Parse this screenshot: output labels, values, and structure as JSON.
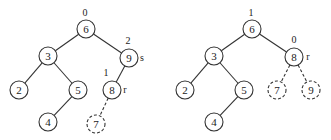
{
  "trees": [
    {
      "nodes": [
        {
          "id": "6",
          "label": "6",
          "x": 86,
          "y": 29,
          "dashed": false,
          "annot": "0",
          "ax": 85,
          "ay": 16
        },
        {
          "id": "3",
          "label": "3",
          "x": 48,
          "y": 56,
          "dashed": false
        },
        {
          "id": "9",
          "label": "9",
          "x": 129,
          "y": 58,
          "dashed": false,
          "annot": "2",
          "ax": 128,
          "ay": 44,
          "side": "s",
          "sx": 142,
          "sy": 61
        },
        {
          "id": "2",
          "label": "2",
          "x": 19,
          "y": 90,
          "dashed": false
        },
        {
          "id": "5",
          "label": "5",
          "x": 78,
          "y": 90,
          "dashed": false
        },
        {
          "id": "8",
          "label": "8",
          "x": 112,
          "y": 90,
          "dashed": false,
          "annot": "1",
          "ax": 106,
          "ay": 76,
          "side": "r",
          "sx": 125,
          "sy": 93
        },
        {
          "id": "4",
          "label": "4",
          "x": 48,
          "y": 122,
          "dashed": false
        },
        {
          "id": "7",
          "label": "7",
          "x": 96,
          "y": 124,
          "dashed": true
        }
      ],
      "edges": [
        {
          "from": "6",
          "to": "3",
          "dashed": false
        },
        {
          "from": "6",
          "to": "9",
          "dashed": false
        },
        {
          "from": "3",
          "to": "2",
          "dashed": false
        },
        {
          "from": "3",
          "to": "5",
          "dashed": false
        },
        {
          "from": "9",
          "to": "8",
          "dashed": false
        },
        {
          "from": "5",
          "to": "4",
          "dashed": false
        },
        {
          "from": "8",
          "to": "7",
          "dashed": true
        }
      ]
    },
    {
      "nodes": [
        {
          "id": "6",
          "label": "6",
          "x": 252,
          "y": 29,
          "dashed": false,
          "annot": "1",
          "ax": 251,
          "ay": 16
        },
        {
          "id": "3",
          "label": "3",
          "x": 214,
          "y": 56,
          "dashed": false
        },
        {
          "id": "8",
          "label": "8",
          "x": 294,
          "y": 57,
          "dashed": false,
          "annot": "0",
          "ax": 294,
          "ay": 43,
          "side": "r",
          "sx": 308,
          "sy": 60
        },
        {
          "id": "2",
          "label": "2",
          "x": 185,
          "y": 90,
          "dashed": false
        },
        {
          "id": "5",
          "label": "5",
          "x": 244,
          "y": 90,
          "dashed": false
        },
        {
          "id": "7",
          "label": "7",
          "x": 277,
          "y": 90,
          "dashed": true
        },
        {
          "id": "9",
          "label": "9",
          "x": 311,
          "y": 90,
          "dashed": true
        },
        {
          "id": "4",
          "label": "4",
          "x": 214,
          "y": 122,
          "dashed": false
        }
      ],
      "edges": [
        {
          "from": "6",
          "to": "3",
          "dashed": false
        },
        {
          "from": "6",
          "to": "8",
          "dashed": false
        },
        {
          "from": "3",
          "to": "2",
          "dashed": false
        },
        {
          "from": "3",
          "to": "5",
          "dashed": false
        },
        {
          "from": "8",
          "to": "7",
          "dashed": true
        },
        {
          "from": "8",
          "to": "9",
          "dashed": true
        },
        {
          "from": "5",
          "to": "4",
          "dashed": false
        }
      ]
    }
  ],
  "node_radius": 9
}
